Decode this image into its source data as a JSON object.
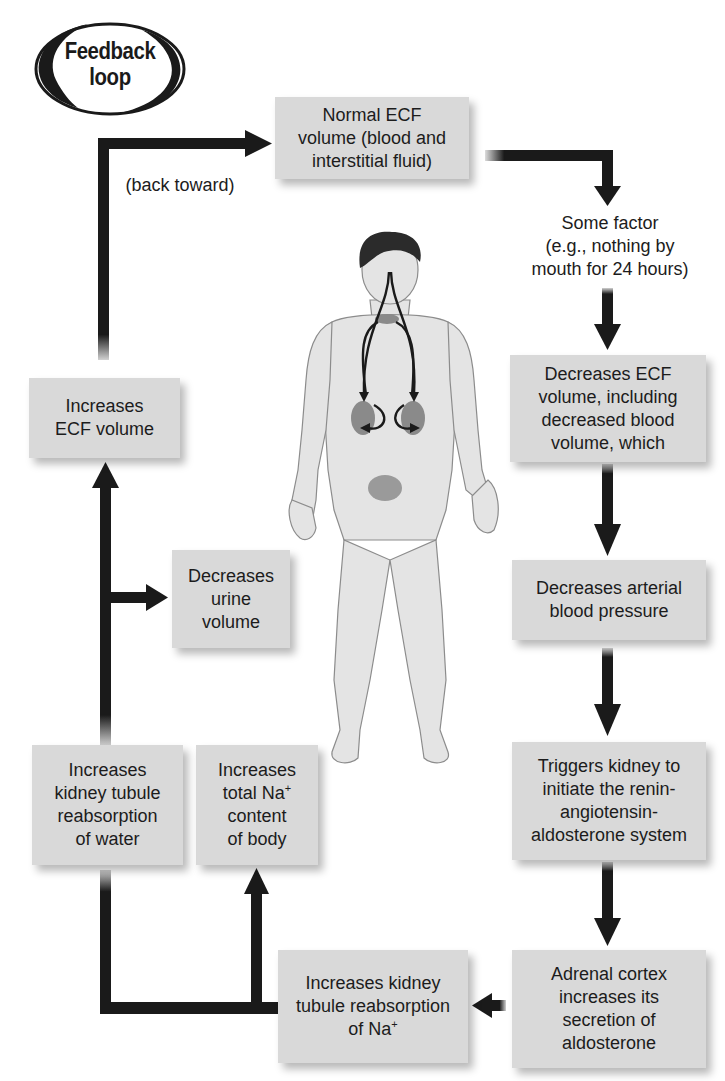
{
  "badge": {
    "line1": "Feedback",
    "line2": "loop"
  },
  "labels": {
    "back_toward": "(back toward)"
  },
  "nodes": {
    "normal_ecf": "Normal ECF\nvolume (blood and\ninterstitial fluid)",
    "some_factor": "Some factor\n(e.g., nothing by\nmouth for 24 hours)",
    "decreases_ecf": "Decreases ECF\nvolume, including\ndecreased blood\nvolume, which",
    "decreases_bp": "Decreases arterial\nblood pressure",
    "triggers_kidney": "Triggers kidney to\ninitiate the renin-\nangiotensin-\naldosterone system",
    "adrenal_cortex": "Adrenal cortex\nincreases its\nsecretion of\naldosterone",
    "increases_na_reabsorption": {
      "line1": "Increases kidney",
      "line2": "tubule reabsorption",
      "line3_prefix": "of Na",
      "line3_sup": "+"
    },
    "increases_total_na": {
      "line1": "Increases",
      "line2_prefix": "total Na",
      "line2_sup": "+",
      "line3": "content",
      "line4": "of body"
    },
    "increases_water_reabsorption": "Increases\nkidney tubule\nreabsorption\nof water",
    "decreases_urine": "Decreases\nurine\nvolume",
    "increases_ecf": "Increases\nECF volume"
  },
  "colors": {
    "box_fill": "#d9d9d9",
    "arrow": "#1a1a1a",
    "skin": "#e6e6e6",
    "hair": "#2b2b2b",
    "organ": "#8a8a8a"
  },
  "illustration": {
    "subject": "human-body-figure",
    "organs": [
      "kidneys",
      "adrenal-region",
      "bladder"
    ]
  }
}
